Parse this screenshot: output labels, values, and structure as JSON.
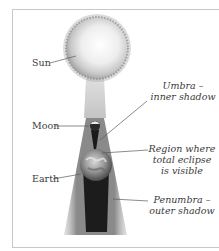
{
  "diagram": {
    "labels": {
      "sun": "Sun",
      "moon": "Moon",
      "earth": "Earth",
      "umbra_line1": "Umbra –",
      "umbra_line2": "inner shadow",
      "region_line1": "Region where",
      "region_line2": "total eclipse",
      "region_line3": "is visible",
      "penumbra_line1": "Penumbra –",
      "penumbra_line2": "outer shadow"
    },
    "colors": {
      "frame": "#c8c8c8",
      "sun_core": "#ffffff",
      "sun_edge": "#b8b8b8",
      "penumbra": "#8a8a8a",
      "umbra": "#1a1a1a",
      "leader": "#5a5a5a",
      "text": "#3a3a3a"
    }
  }
}
